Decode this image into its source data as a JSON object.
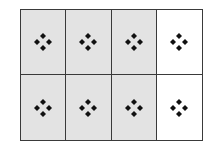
{
  "diagram": {
    "rows": 2,
    "columns": 4,
    "shaded_color": "#e3e3e3",
    "unshaded_color": "#ffffff",
    "line_color": "#3a3a3a",
    "symbol_color": "#111111",
    "cells": [
      {
        "row": 0,
        "col": 0,
        "shaded": true,
        "symbol": "four-diamond-cluster"
      },
      {
        "row": 0,
        "col": 1,
        "shaded": true,
        "symbol": "four-diamond-cluster"
      },
      {
        "row": 0,
        "col": 2,
        "shaded": true,
        "symbol": "four-diamond-cluster"
      },
      {
        "row": 0,
        "col": 3,
        "shaded": false,
        "symbol": "four-diamond-cluster"
      },
      {
        "row": 1,
        "col": 0,
        "shaded": true,
        "symbol": "four-diamond-cluster"
      },
      {
        "row": 1,
        "col": 1,
        "shaded": true,
        "symbol": "four-diamond-cluster"
      },
      {
        "row": 1,
        "col": 2,
        "shaded": true,
        "symbol": "four-diamond-cluster"
      },
      {
        "row": 1,
        "col": 3,
        "shaded": false,
        "symbol": "four-diamond-cluster"
      }
    ]
  }
}
